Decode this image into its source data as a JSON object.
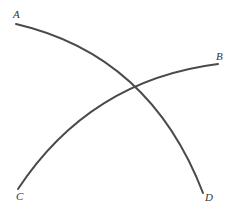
{
  "diagram": {
    "type": "two intersecting arcs",
    "labels": {
      "a": "A",
      "b": "B",
      "c": "C",
      "d": "D"
    },
    "arcs": [
      {
        "name": "arc-AD",
        "from": "A",
        "to": "D"
      },
      {
        "name": "arc-CB",
        "from": "C",
        "to": "B"
      }
    ],
    "colors": {
      "stroke": "#4a4a4a",
      "label": "#333333",
      "background": "#ffffff"
    }
  }
}
